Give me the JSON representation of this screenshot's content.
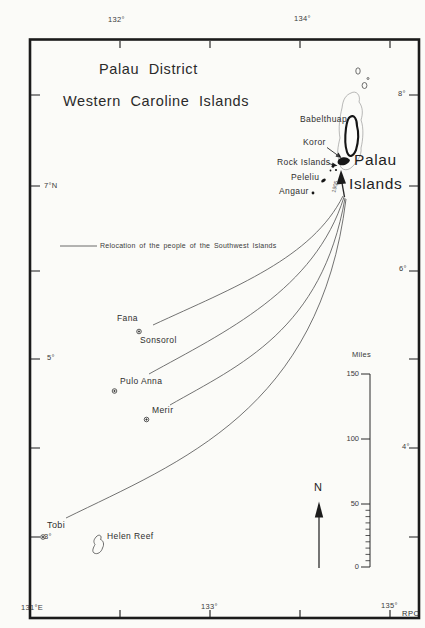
{
  "title": {
    "line1": "Palau District",
    "line2": "Western Caroline Islands"
  },
  "legend": {
    "label": "Relocation of the people of the Southwest Islands"
  },
  "region": {
    "line1": "Palau",
    "line2": "Islands"
  },
  "route_year": "1905",
  "islands": {
    "babelthuap": "Babelthuap",
    "koror": "Koror",
    "rock_islands": "Rock Islands",
    "peleliu": "Peleliu",
    "angaur": "Angaur",
    "fana": "Fana",
    "sonsorol": "Sonsorol",
    "pulo_anna": "Pulo Anna",
    "merir": "Merir",
    "tobi": "Tobi",
    "helen_reef": "Helen Reef"
  },
  "axis": {
    "top": [
      {
        "text": "132°"
      },
      {
        "text": "134°"
      }
    ],
    "bottom": [
      {
        "text": "131°E"
      },
      {
        "text": "133°"
      },
      {
        "text": "135°"
      }
    ],
    "left": [
      {
        "text": "7°N"
      },
      {
        "text": "5°"
      },
      {
        "text": "3°"
      }
    ],
    "right": [
      {
        "text": "8°"
      },
      {
        "text": "6°"
      },
      {
        "text": "4°"
      }
    ]
  },
  "scale": {
    "unit": "Miles",
    "labels": [
      "150",
      "100",
      "50",
      "0"
    ]
  },
  "compass": {
    "north": "N"
  },
  "credit": "RPC",
  "colors": {
    "ink": "#2b2b2b",
    "route_line": "#5a5a5a",
    "paper": "#fbfbf8"
  }
}
